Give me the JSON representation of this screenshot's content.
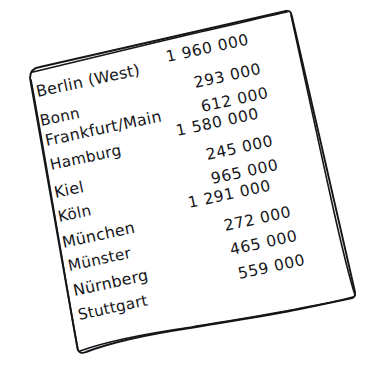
{
  "sheet": {
    "kind": "hand-drawn paper note",
    "background_color": "#ffffff",
    "ink_color": "#15161a",
    "paper_fill": "#ffffff"
  },
  "list": {
    "title": "",
    "rows": [
      {
        "city": "Berlin (West)",
        "amount": "1 960 000"
      },
      {
        "city": "Bonn",
        "amount": "293 000"
      },
      {
        "city": "Frankfurt/Main",
        "amount": "612 000"
      },
      {
        "city": "Hamburg",
        "amount": "1 580 000"
      },
      {
        "city": "Kiel",
        "amount": "245 000"
      },
      {
        "city": "Köln",
        "amount": "965 000"
      },
      {
        "city": "München",
        "amount": "1 291 000"
      },
      {
        "city": "Münster",
        "amount": "272 000"
      },
      {
        "city": "Nürnberg",
        "amount": "465 000"
      },
      {
        "city": "Stuttgart",
        "amount": "559 000"
      }
    ]
  }
}
